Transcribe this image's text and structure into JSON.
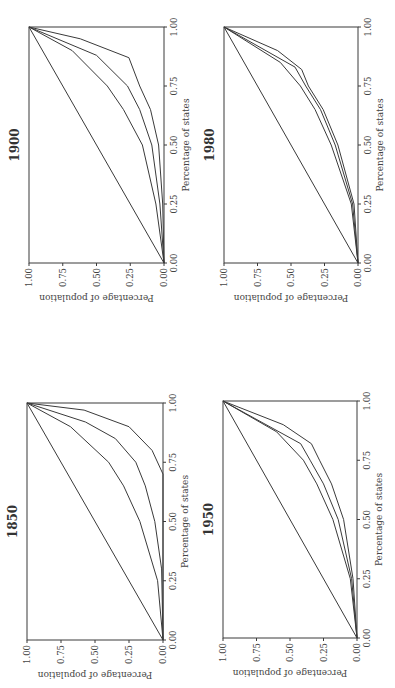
{
  "figure": {
    "orientation": "rotated 90 degrees counter-clockwise",
    "ink_color": "#3a3a3a"
  },
  "chart_data": [
    {
      "type": "line",
      "title": "1850",
      "xlabel": "Percentage of states",
      "ylabel": "Percentage of population",
      "xticks": [
        "0.00",
        "0.25",
        "0.50",
        "0.75",
        "1.00"
      ],
      "yticks": [
        "0.00",
        "0.25",
        "0.50",
        "0.75",
        "1.00"
      ],
      "xlim": [
        0,
        1
      ],
      "ylim": [
        0,
        1
      ],
      "grid": false,
      "legend": "none",
      "series": [
        {
          "name": "equality line",
          "x": [
            0,
            1
          ],
          "y": [
            0,
            1
          ]
        },
        {
          "name": "curve 1",
          "x": [
            0,
            0.25,
            0.5,
            0.65,
            0.75,
            0.9,
            1
          ],
          "y": [
            0,
            0.04,
            0.17,
            0.29,
            0.4,
            0.68,
            1
          ]
        },
        {
          "name": "curve 2",
          "x": [
            0,
            0.3,
            0.5,
            0.65,
            0.75,
            0.85,
            0.92,
            1
          ],
          "y": [
            0,
            0.01,
            0.06,
            0.13,
            0.2,
            0.35,
            0.57,
            1
          ]
        },
        {
          "name": "curve 3",
          "x": [
            0,
            0.7,
            0.8,
            0.9,
            0.97,
            1
          ],
          "y": [
            0,
            0,
            0.08,
            0.25,
            0.58,
            1
          ]
        }
      ]
    },
    {
      "type": "line",
      "title": "1900",
      "xlabel": "Percentage of states",
      "ylabel": "Percentage of population",
      "xticks": [
        "0.00",
        "0.25",
        "0.50",
        "0.75",
        "1.00"
      ],
      "yticks": [
        "0.00",
        "0.25",
        "0.50",
        "0.75",
        "1.00"
      ],
      "xlim": [
        0,
        1
      ],
      "ylim": [
        0,
        1
      ],
      "grid": false,
      "legend": "none",
      "series": [
        {
          "name": "equality line",
          "x": [
            0,
            1
          ],
          "y": [
            0,
            1
          ]
        },
        {
          "name": "curve 1",
          "x": [
            0,
            0.25,
            0.5,
            0.65,
            0.75,
            0.9,
            1
          ],
          "y": [
            0,
            0.06,
            0.16,
            0.3,
            0.42,
            0.68,
            1
          ]
        },
        {
          "name": "curve 2",
          "x": [
            0,
            0.25,
            0.5,
            0.65,
            0.75,
            0.88,
            1
          ],
          "y": [
            0,
            0.03,
            0.09,
            0.18,
            0.27,
            0.5,
            1
          ]
        },
        {
          "name": "curve 3",
          "x": [
            0,
            0.25,
            0.5,
            0.65,
            0.75,
            0.87,
            0.95,
            1
          ],
          "y": [
            0,
            0.01,
            0.04,
            0.1,
            0.18,
            0.26,
            0.62,
            1
          ]
        }
      ]
    },
    {
      "type": "line",
      "title": "1950",
      "xlabel": "Percentage of states",
      "ylabel": "Percentage of population",
      "xticks": [
        "0.00",
        "0.25",
        "0.50",
        "0.75",
        "1.00"
      ],
      "yticks": [
        "0.00",
        "0.25",
        "0.50",
        "0.75",
        "1.00"
      ],
      "xlim": [
        0,
        1
      ],
      "ylim": [
        0,
        1
      ],
      "grid": false,
      "legend": "none",
      "series": [
        {
          "name": "equality line",
          "x": [
            0,
            1
          ],
          "y": [
            0,
            1
          ]
        },
        {
          "name": "curve 1",
          "x": [
            0,
            0.25,
            0.5,
            0.65,
            0.75,
            0.87,
            1
          ],
          "y": [
            0,
            0.05,
            0.18,
            0.3,
            0.4,
            0.6,
            1
          ]
        },
        {
          "name": "curve 2",
          "x": [
            0,
            0.25,
            0.5,
            0.65,
            0.75,
            0.82,
            1
          ],
          "y": [
            0,
            0.04,
            0.14,
            0.25,
            0.35,
            0.42,
            1
          ]
        },
        {
          "name": "curve 3",
          "x": [
            0,
            0.25,
            0.5,
            0.65,
            0.75,
            0.82,
            0.9,
            1
          ],
          "y": [
            0,
            0.03,
            0.1,
            0.19,
            0.28,
            0.34,
            0.55,
            1
          ]
        }
      ]
    },
    {
      "type": "line",
      "title": "1980",
      "xlabel": "Percentage of states",
      "ylabel": "Percentage of population",
      "xticks": [
        "0.00",
        "0.25",
        "0.50",
        "0.75",
        "1.00"
      ],
      "yticks": [
        "0.00",
        "0.25",
        "0.50",
        "0.75",
        "1.00"
      ],
      "xlim": [
        0,
        1
      ],
      "ylim": [
        0,
        1
      ],
      "grid": false,
      "legend": "none",
      "series": [
        {
          "name": "equality line",
          "x": [
            0,
            1
          ],
          "y": [
            0,
            1
          ]
        },
        {
          "name": "curve 1",
          "x": [
            0,
            0.25,
            0.5,
            0.65,
            0.75,
            0.85,
            1
          ],
          "y": [
            0,
            0.05,
            0.2,
            0.32,
            0.43,
            0.58,
            1
          ]
        },
        {
          "name": "curve 2",
          "x": [
            0,
            0.25,
            0.5,
            0.65,
            0.75,
            0.83,
            1
          ],
          "y": [
            0,
            0.04,
            0.17,
            0.28,
            0.39,
            0.47,
            1
          ]
        },
        {
          "name": "curve 3",
          "x": [
            0,
            0.25,
            0.5,
            0.65,
            0.75,
            0.82,
            0.9,
            1
          ],
          "y": [
            0,
            0.03,
            0.15,
            0.26,
            0.37,
            0.42,
            0.6,
            1
          ]
        }
      ]
    }
  ],
  "panels": [
    {
      "title": "1850",
      "xlabel": "Percentage of states",
      "ylabel": "Percentage of population",
      "xticks": [
        "0.00",
        "0.25",
        "0.50",
        "0.75",
        "1.00"
      ],
      "yticks": [
        "0.00",
        "0.25",
        "0.50",
        "0.75",
        "1.00"
      ]
    },
    {
      "title": "1900",
      "xlabel": "Percentage of states",
      "ylabel": "Percentage of population",
      "xticks": [
        "0.00",
        "0.25",
        "0.50",
        "0.75",
        "1.00"
      ],
      "yticks": [
        "0.00",
        "0.25",
        "0.50",
        "0.75",
        "1.00"
      ]
    },
    {
      "title": "1950",
      "xlabel": "Percentage of states",
      "ylabel": "Percentage of population",
      "xticks": [
        "0.00",
        "0.25",
        "0.50",
        "0.75",
        "1.00"
      ],
      "yticks": [
        "0.00",
        "0.25",
        "0.50",
        "0.75",
        "1.00"
      ]
    },
    {
      "title": "1980",
      "xlabel": "Percentage of states",
      "ylabel": "Percentage of population",
      "xticks": [
        "0.00",
        "0.25",
        "0.50",
        "0.75",
        "1.00"
      ],
      "yticks": [
        "0.00",
        "0.25",
        "0.50",
        "0.75",
        "1.00"
      ]
    }
  ]
}
